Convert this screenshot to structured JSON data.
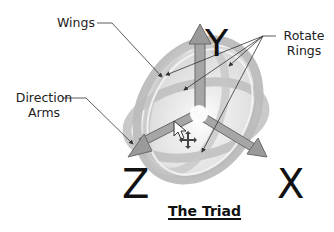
{
  "diagram": {
    "title": "The Triad",
    "labels": {
      "wings": "Wings",
      "direction_arms_line1": "Direction",
      "direction_arms_line2": "Arms",
      "rotate_rings_line1": "Rotate",
      "rotate_rings_line2": "Rings"
    },
    "axes": {
      "x": "X",
      "y": "Y",
      "z": "Z"
    },
    "icons": {
      "cursor": "mouse-pointer-icon",
      "move": "move-cross-icon"
    },
    "colors": {
      "ring": "#b4b4b4",
      "ring_light": "#d6d6d6",
      "arm": "#9a9a9a",
      "arm_outline": "#6a6a6a",
      "wing": "#e6e6e6",
      "leader_line": "#333333",
      "text": "#222222"
    }
  }
}
